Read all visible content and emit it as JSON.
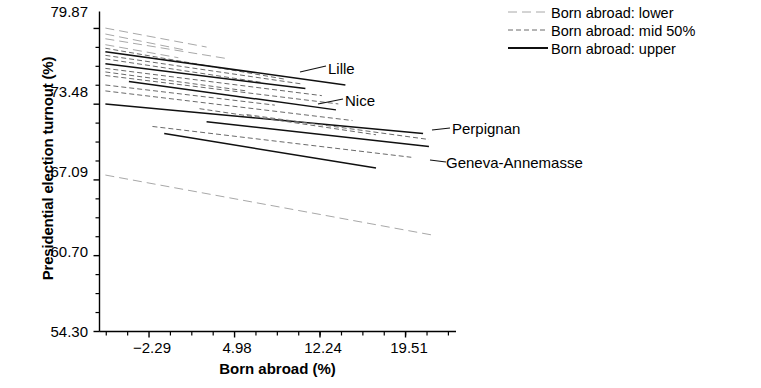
{
  "chart_data": {
    "type": "line",
    "title": "",
    "xlabel": "Born abroad (%)",
    "ylabel": "Presidential election turnout (%)",
    "xticks": [
      -2.29,
      4.98,
      12.24,
      19.51
    ],
    "xtick_labels": [
      "−2.29",
      "4.98",
      "12.24",
      "19.51"
    ],
    "yticks": [
      54.3,
      60.7,
      67.09,
      73.48,
      79.87
    ],
    "ytick_labels": [
      "54.30",
      "60.70",
      "67.09",
      "73.48",
      "79.87"
    ],
    "xlim": [
      -6.5,
      23.8
    ],
    "ylim": [
      54.3,
      81.3
    ],
    "grid": false,
    "legend_position": "upper right",
    "legend": [
      {
        "label": "Born abroad: lower",
        "style": "dashed"
      },
      {
        "label": "Born abroad: mid 50%",
        "style": "fine-dashed"
      },
      {
        "label": "Born abroad: upper",
        "style": "solid"
      }
    ],
    "annotations": [
      {
        "text": "Lille",
        "x": 11.0,
        "y": 76.4
      },
      {
        "text": "Nice",
        "x": 13.6,
        "y": 73.9
      },
      {
        "text": "Perpignan",
        "x": 21.3,
        "y": 71.8
      },
      {
        "text": "Geneva-Annemasse",
        "x": 21.3,
        "y": 69.2
      }
    ],
    "series": [
      {
        "name": "Born abroad: lower",
        "style": "dashed",
        "x": [
          -6.0,
          2.6
        ],
        "y": [
          79.9,
          78.3
        ]
      },
      {
        "name": "Born abroad: lower",
        "style": "dashed",
        "x": [
          -6.0,
          1.0
        ],
        "y": [
          79.4,
          78.0
        ]
      },
      {
        "name": "Born abroad: lower",
        "style": "dashed",
        "x": [
          -6.0,
          4.5
        ],
        "y": [
          79.0,
          77.3
        ]
      },
      {
        "name": "Born abroad: lower",
        "style": "dashed",
        "x": [
          -6.0,
          0.2
        ],
        "y": [
          78.5,
          77.4
        ]
      },
      {
        "name": "Born abroad: mid 50%",
        "style": "fine-dashed",
        "x": [
          -6.0,
          9.2
        ],
        "y": [
          78.2,
          75.6
        ]
      },
      {
        "name": "Born abroad: upper",
        "style": "solid",
        "x": [
          -6.0,
          14.4
        ],
        "y": [
          77.9,
          75.1
        ]
      },
      {
        "name": "Born abroad: mid 50%",
        "style": "fine-dashed",
        "x": [
          -6.0,
          10.6
        ],
        "y": [
          77.6,
          75.2
        ]
      },
      {
        "name": "Born abroad: mid 50%",
        "style": "fine-dashed",
        "x": [
          -6.0,
          7.4
        ],
        "y": [
          77.3,
          75.3
        ]
      },
      {
        "name": "Born abroad: upper",
        "style": "solid",
        "x": [
          -6.0,
          11.0
        ],
        "y": [
          76.9,
          74.8
        ]
      },
      {
        "name": "Born abroad: mid 50%",
        "style": "fine-dashed",
        "x": [
          -6.0,
          12.4
        ],
        "y": [
          76.5,
          74.2
        ]
      },
      {
        "name": "Born abroad: mid 50%",
        "style": "fine-dashed",
        "x": [
          -6.0,
          6.0
        ],
        "y": [
          76.2,
          74.6
        ]
      },
      {
        "name": "Born abroad: mid 50%",
        "style": "fine-dashed",
        "x": [
          -6.0,
          13.8
        ],
        "y": [
          75.9,
          73.5
        ]
      },
      {
        "name": "Born abroad: upper",
        "style": "solid",
        "x": [
          -4.0,
          13.6
        ],
        "y": [
          75.4,
          73.0
        ]
      },
      {
        "name": "Born abroad: mid 50%",
        "style": "fine-dashed",
        "x": [
          -6.0,
          8.4
        ],
        "y": [
          75.1,
          73.4
        ]
      },
      {
        "name": "Born abroad: mid 50%",
        "style": "fine-dashed",
        "x": [
          -6.0,
          15.0
        ],
        "y": [
          74.6,
          72.1
        ]
      },
      {
        "name": "Born abroad: upper",
        "style": "solid",
        "x": [
          -6.0,
          21.0
        ],
        "y": [
          73.5,
          71.0
        ]
      },
      {
        "name": "Born abroad: mid 50%",
        "style": "fine-dashed",
        "x": [
          2.0,
          17.0
        ],
        "y": [
          73.1,
          70.9
        ]
      },
      {
        "name": "Born abroad: mid 50%",
        "style": "fine-dashed",
        "x": [
          6.0,
          21.5
        ],
        "y": [
          72.6,
          70.5
        ]
      },
      {
        "name": "Born abroad: upper",
        "style": "solid",
        "x": [
          2.6,
          21.5
        ],
        "y": [
          72.0,
          69.9
        ]
      },
      {
        "name": "Born abroad: mid 50%",
        "style": "fine-dashed",
        "x": [
          -2.0,
          20.0
        ],
        "y": [
          71.6,
          69.0
        ]
      },
      {
        "name": "Born abroad: upper",
        "style": "solid",
        "x": [
          -1.0,
          17.0
        ],
        "y": [
          71.0,
          68.1
        ]
      },
      {
        "name": "Born abroad: lower",
        "style": "dashed",
        "x": [
          -6.0,
          22.0
        ],
        "y": [
          67.5,
          62.4
        ]
      }
    ]
  },
  "axis": {
    "tick_color": "#000000",
    "axis_color": "#000000"
  }
}
